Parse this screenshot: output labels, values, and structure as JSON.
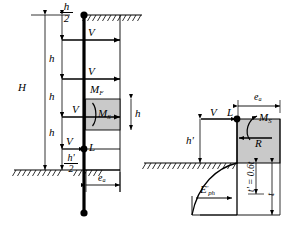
{
  "figure": {
    "colors": {
      "line": "#000000",
      "block_fill": "#c9c9c9",
      "ground_line": "#000000",
      "background": "#ffffff"
    }
  },
  "left_diagram": {
    "name": "wall-elevation",
    "dimension_labels": {
      "total_height": "H",
      "top_half_spacing_num": "h",
      "top_half_spacing_den": "2",
      "spacing_1": "h",
      "spacing_2": "h",
      "spacing_3": "h",
      "block_height": "h",
      "bottom_half_num": "h'",
      "bottom_half_den": "2",
      "eccentricity": "e",
      "eccentricity_sub": "a"
    },
    "force_labels": {
      "shear_1": "V",
      "shear_2": "V",
      "shear_3": "V",
      "shear_4": "V",
      "moment_frame": "M",
      "moment_frame_sub": "F",
      "moment_soil": "M",
      "moment_soil_sub": "S",
      "load_point": "L"
    }
  },
  "right_diagram": {
    "name": "footing-detail",
    "labels": {
      "shear": "V",
      "load_point": "L",
      "moment_soil": "M",
      "moment_soil_sub": "S",
      "reaction": "R",
      "eccentricity": "e",
      "eccentricity_sub": "a",
      "height_above": "h'",
      "passive_pressure": "E",
      "passive_pressure_sub": "ph",
      "passive_pressure_prime": "'",
      "embedment_reduced": "t' = 0.6t",
      "embedment_total": "t"
    }
  }
}
